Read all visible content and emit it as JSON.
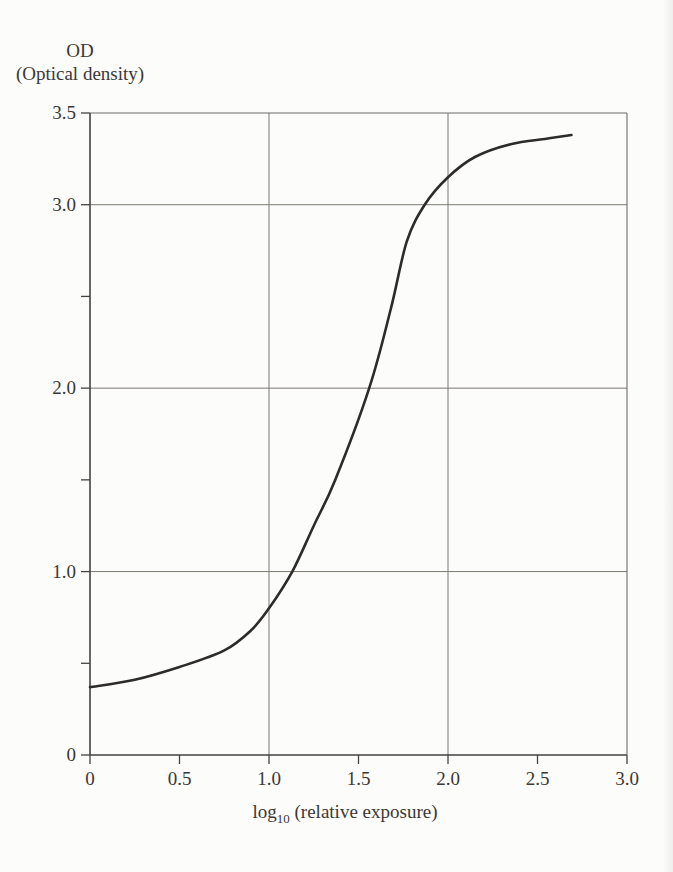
{
  "figure": {
    "background": "#fcfcfa",
    "title_block": {
      "line1": "OD",
      "line2": "(Optical density)"
    }
  },
  "colors": {
    "curve": "#2e2c2b",
    "gridline": "#7d7973",
    "border": "#6f6b66",
    "axis": "#45423f",
    "text": "#3b3835",
    "background": "#fcfcfa"
  },
  "chart_data": {
    "type": "line",
    "ylabel": "OD (Optical density)",
    "xlabel": "log10 (relative exposure)",
    "xlabel_parts": {
      "prefix": "log",
      "sub": "10",
      "suffix": " (relative exposure)"
    },
    "xlim": [
      0,
      3.0
    ],
    "ylim": [
      0,
      3.5
    ],
    "grid": "boxed frame; major gridlines at x=1.0,2.0 and y=1.0,2.0,3.0; minor ticks every 0.5",
    "legend": "none",
    "x_ticks": [
      {
        "value": 0,
        "label": "0",
        "grid": false
      },
      {
        "value": 0.5,
        "label": "0.5",
        "grid": false
      },
      {
        "value": 1.0,
        "label": "1.0",
        "grid": true
      },
      {
        "value": 1.5,
        "label": "1.5",
        "grid": false
      },
      {
        "value": 2.0,
        "label": "2.0",
        "grid": true
      },
      {
        "value": 2.5,
        "label": "2.5",
        "grid": false
      },
      {
        "value": 3.0,
        "label": "3.0",
        "grid": false
      }
    ],
    "y_ticks": [
      {
        "value": 0,
        "label": "0",
        "grid": false
      },
      {
        "value": 0.5,
        "label": "",
        "grid": false
      },
      {
        "value": 1.0,
        "label": "1.0",
        "grid": true
      },
      {
        "value": 1.5,
        "label": "",
        "grid": false
      },
      {
        "value": 2.0,
        "label": "2.0",
        "grid": true
      },
      {
        "value": 2.5,
        "label": "",
        "grid": false
      },
      {
        "value": 3.0,
        "label": "3.0",
        "grid": true
      },
      {
        "value": 3.5,
        "label": "3.5",
        "grid": false
      }
    ],
    "series": [
      {
        "name": "characteristic-curve",
        "color": "#2e2c2b",
        "points": [
          [
            0,
            0.37
          ],
          [
            0.25,
            0.41
          ],
          [
            0.5,
            0.48
          ],
          [
            0.75,
            0.57
          ],
          [
            0.9,
            0.68
          ],
          [
            1.0,
            0.8
          ],
          [
            1.13,
            1.0
          ],
          [
            1.25,
            1.25
          ],
          [
            1.37,
            1.5
          ],
          [
            1.56,
            2.0
          ],
          [
            1.68,
            2.43
          ],
          [
            1.77,
            2.8
          ],
          [
            1.87,
            3.0
          ],
          [
            2.0,
            3.15
          ],
          [
            2.15,
            3.26
          ],
          [
            2.35,
            3.33
          ],
          [
            2.55,
            3.36
          ],
          [
            2.69,
            3.38
          ]
        ]
      }
    ]
  }
}
